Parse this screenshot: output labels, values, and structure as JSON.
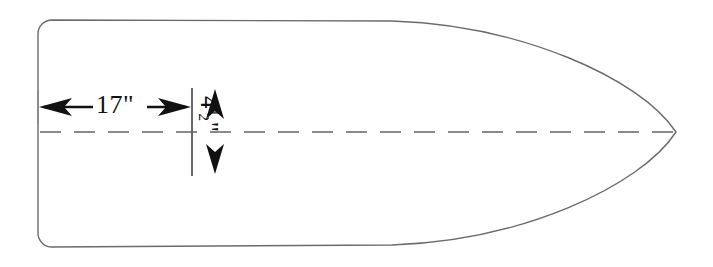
{
  "drawing": {
    "title": "Hull plan outline with dimensions",
    "background_color": "#ffffff",
    "outline_color": "#6b6b6b",
    "dimension_color": "#111111",
    "centerline_color": "#8a8a8a",
    "dimensions": [
      {
        "id": "length-offset",
        "value": "17\"",
        "orientation": "horizontal",
        "arrow_style": "double-headed",
        "from_x": 40,
        "to_x": 191,
        "y": 107
      },
      {
        "id": "half-beam",
        "value": "4",
        "fraction_numerator": "1",
        "fraction_denominator": "2",
        "unit": "\"",
        "orientation": "vertical",
        "arrow_style": "double-headed",
        "x": 215,
        "from_y": 89,
        "to_y": 174
      }
    ],
    "centerline": {
      "id": "centerline",
      "y": 132,
      "from_x": 40,
      "to_x": 676,
      "dash": "21 13"
    },
    "station_line": {
      "id": "station-tick",
      "x": 192,
      "from_y": 88,
      "to_y": 176
    },
    "hull": {
      "id": "hull-outline",
      "left_x": 38,
      "top_y": 20,
      "bottom_y": 248,
      "tip_x": 676,
      "corner_radius": 14,
      "curve_start_x": 392
    }
  }
}
